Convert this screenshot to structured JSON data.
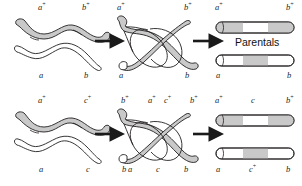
{
  "figure": {
    "background_color": "#ffffff",
    "ink_color": "#231f20",
    "shaded_chromatid_color": "#c9c9c9",
    "unshaded_chromatid_color": "#ffffff",
    "arrow_color": "#1a1a1a"
  },
  "panels": [
    {
      "id": "top-panel",
      "name": "two-point-cross",
      "stages": [
        {
          "id": "top-stage-1",
          "name": "paired-homologs",
          "labels_top": [
            {
              "text": "a",
              "sup": "+",
              "x": 38,
              "y": 4
            },
            {
              "text": "b",
              "sup": "+",
              "x": 82,
              "y": 4
            }
          ],
          "labels_bottom": [
            {
              "text": "a",
              "sup": "",
              "x": 39,
              "y": 72
            },
            {
              "text": "b",
              "sup": "",
              "x": 84,
              "y": 72
            }
          ]
        },
        {
          "id": "top-stage-2",
          "name": "crossover-chiasma",
          "labels_top": [
            {
              "text": "a",
              "sup": "+",
              "x": 117,
              "y": 4
            },
            {
              "text": "b",
              "sup": "+",
              "x": 184,
              "y": 4
            }
          ],
          "labels_bottom": [
            {
              "text": "a",
              "sup": "",
              "x": 119,
              "y": 72
            },
            {
              "text": "b",
              "sup": "",
              "x": 185,
              "y": 72
            }
          ]
        },
        {
          "id": "top-stage-3",
          "name": "parental-products",
          "labels_top": [
            {
              "text": "a",
              "sup": "+",
              "x": 215,
              "y": 4
            },
            {
              "text": "b",
              "sup": "+",
              "x": 286,
              "y": 4
            }
          ],
          "labels_bottom": [
            {
              "text": "a",
              "sup": "",
              "x": 216,
              "y": 72
            },
            {
              "text": "b",
              "sup": "",
              "x": 287,
              "y": 72
            }
          ],
          "caption": {
            "text": "Parentals",
            "x": 235,
            "y": 38
          }
        }
      ]
    },
    {
      "id": "bottom-panel",
      "name": "three-point-cross",
      "stages": [
        {
          "id": "bottom-stage-1",
          "name": "paired-homologs",
          "labels_top": [
            {
              "text": "a",
              "sup": "+",
              "x": 38,
              "y": 97
            },
            {
              "text": "c",
              "sup": "+",
              "x": 84,
              "y": 97
            },
            {
              "text": "b",
              "sup": "+",
              "x": 121,
              "y": 97
            }
          ],
          "labels_bottom": [
            {
              "text": "a",
              "sup": "",
              "x": 39,
              "y": 166
            },
            {
              "text": "c",
              "sup": "",
              "x": 86,
              "y": 166
            },
            {
              "text": "b",
              "sup": "",
              "x": 122,
              "y": 166
            }
          ]
        },
        {
          "id": "bottom-stage-2",
          "name": "crossover-chiasma",
          "labels_top": [
            {
              "text": "a",
              "sup": "+",
              "x": 148,
              "y": 97
            },
            {
              "text": "c",
              "sup": "+",
              "x": 164,
              "y": 97
            },
            {
              "text": "b",
              "sup": "+",
              "x": 190,
              "y": 97
            }
          ],
          "labels_bottom": [
            {
              "text": "a",
              "sup": "",
              "x": 128,
              "y": 166
            },
            {
              "text": "c",
              "sup": "",
              "x": 156,
              "y": 166
            },
            {
              "text": "b",
              "sup": "",
              "x": 184,
              "y": 166
            }
          ]
        },
        {
          "id": "bottom-stage-3",
          "name": "recombinant-products",
          "labels_top": [
            {
              "text": "a",
              "sup": "+",
              "x": 215,
              "y": 97
            },
            {
              "text": "c",
              "sup": "",
              "x": 251,
              "y": 97
            },
            {
              "text": "b",
              "sup": "+",
              "x": 286,
              "y": 97
            }
          ],
          "labels_bottom": [
            {
              "text": "a",
              "sup": "",
              "x": 216,
              "y": 166
            },
            {
              "text": "c",
              "sup": "+",
              "x": 249,
              "y": 166
            },
            {
              "text": "b",
              "sup": "",
              "x": 286,
              "y": 166
            }
          ]
        }
      ]
    }
  ],
  "arrows": [
    {
      "id": "arrow-top-left",
      "x": 95,
      "y": 41
    },
    {
      "id": "arrow-top-right",
      "x": 186,
      "y": 41
    },
    {
      "id": "arrow-bottom-left",
      "x": 95,
      "y": 134
    },
    {
      "id": "arrow-bottom-right",
      "x": 186,
      "y": 134
    }
  ]
}
